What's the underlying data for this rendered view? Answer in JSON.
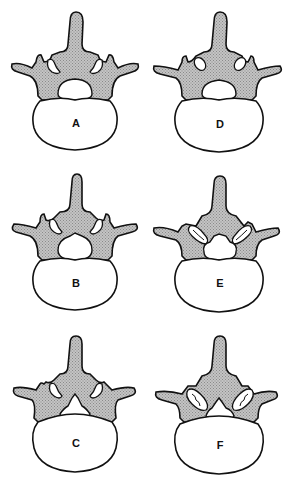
{
  "figure": {
    "colors": {
      "outline": "#111111",
      "bone_fill": "#b8b8b8",
      "body_fill": "#ffffff",
      "background": "#ffffff"
    },
    "panels": [
      {
        "label": "A",
        "column": 0,
        "row": 0,
        "canal": "round",
        "facets": "normal"
      },
      {
        "label": "B",
        "column": 0,
        "row": 1,
        "canal": "narrowed",
        "facets": "normal"
      },
      {
        "label": "C",
        "column": 0,
        "row": 2,
        "canal": "trefoil",
        "facets": "normal"
      },
      {
        "label": "D",
        "column": 1,
        "row": 0,
        "canal": "round",
        "facets": "normal"
      },
      {
        "label": "E",
        "column": 1,
        "row": 1,
        "canal": "narrowed",
        "facets": "hypertrophic"
      },
      {
        "label": "F",
        "column": 1,
        "row": 2,
        "canal": "trefoil",
        "facets": "hypertrophic-degenerative"
      }
    ]
  }
}
